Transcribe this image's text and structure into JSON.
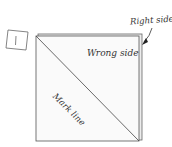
{
  "step": {
    "number": "1"
  },
  "labels": {
    "right_side": "Right side",
    "wrong_side": "Wrong side",
    "mark_line": "Mark line"
  },
  "colors": {
    "line": "#555555",
    "back_square_fill": "#e8e8e8",
    "front_square_fill": "#ffffff"
  }
}
